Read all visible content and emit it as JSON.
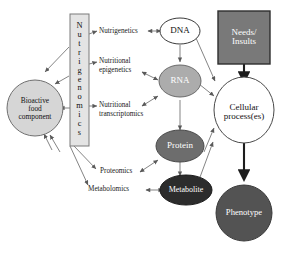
{
  "diagram": {
    "background": "#ffffff",
    "nodes": {
      "nutrigenomics": {
        "label": "Nutrigenomics",
        "letters": [
          "N",
          "u",
          "t",
          "r",
          "i",
          "g",
          "e",
          "n",
          "o",
          "m",
          "i",
          "c",
          "s"
        ],
        "shape": "rect-vertical-text",
        "fill": "#e4e4e4",
        "text_color": "#111111",
        "border": "#7a7a7a"
      },
      "bioactive": {
        "label": "Bioactive food component",
        "lines": [
          "Bioactive",
          "food",
          "component"
        ],
        "shape": "circle",
        "fill": "#d6d6d6",
        "text_color": "#111111",
        "border": "#6f6f6f"
      },
      "dna": {
        "label": "DNA",
        "lines": [
          "DNA"
        ],
        "shape": "ellipse",
        "fill": "#ffffff",
        "text_color": "#111111",
        "border": "#3a3a3a"
      },
      "rna": {
        "label": "RNA",
        "lines": [
          "RNA"
        ],
        "shape": "ellipse",
        "fill": "#acacac",
        "text_color": "#ffffff",
        "border": "#6a6a6a"
      },
      "protein": {
        "label": "Protein",
        "lines": [
          "Protein"
        ],
        "shape": "ellipse",
        "fill": "#6d6d6d",
        "text_color": "#ffffff",
        "border": "#4a4a4a"
      },
      "metabolite": {
        "label": "Metabolite",
        "lines": [
          "Metabolite"
        ],
        "shape": "ellipse",
        "fill": "#2c2c2c",
        "text_color": "#ffffff",
        "border": "#1a1a1a"
      },
      "needs_insults": {
        "label": "Needs/Insults",
        "lines": [
          "Needs/",
          "Insults"
        ],
        "shape": "rect",
        "fill": "#797979",
        "text_color": "#ffffff",
        "border": "#2e2e2e"
      },
      "cellular_process": {
        "label": "Cellular process(es)",
        "lines": [
          "Cellular",
          "process(es)"
        ],
        "shape": "ellipse",
        "fill": "#ffffff",
        "text_color": "#111111",
        "border": "#4a4a4a"
      },
      "phenotype": {
        "label": "Phenotype",
        "lines": [
          "Phenotype"
        ],
        "shape": "circle",
        "fill": "#535353",
        "text_color": "#ffffff",
        "border": "#3a3a3a"
      }
    },
    "edge_labels": [
      {
        "id": "nutrigenetics",
        "text": "Nutrigenetics"
      },
      {
        "id": "nutritional-epigenetics-l1",
        "text": "Nutritional"
      },
      {
        "id": "nutritional-epigenetics-l2",
        "text": "epigenetics"
      },
      {
        "id": "nutritional-transcriptomics-l1",
        "text": "Nutritional"
      },
      {
        "id": "nutritional-transcriptomics-l2",
        "text": "transcriptomics"
      },
      {
        "id": "proteomics",
        "text": "Proteomics"
      },
      {
        "id": "metabolomics",
        "text": "Metabolomics"
      }
    ],
    "edges": [
      {
        "from": "nutrigenetics",
        "to": "dna",
        "type": "double"
      },
      {
        "from": "nutritional-epigenetics",
        "to": "rna",
        "type": "double"
      },
      {
        "from": "nutritional-transcriptomics",
        "to": "rna",
        "type": "double"
      },
      {
        "from": "proteomics",
        "to": "protein",
        "type": "double"
      },
      {
        "from": "metabolomics",
        "to": "metabolite",
        "type": "double"
      },
      {
        "from": "dna",
        "to": "rna",
        "type": "single"
      },
      {
        "from": "rna",
        "to": "protein",
        "type": "single"
      },
      {
        "from": "protein",
        "to": "metabolite",
        "type": "single"
      },
      {
        "from": "dna",
        "to": "cellular_process",
        "type": "single"
      },
      {
        "from": "rna",
        "to": "cellular_process",
        "type": "single"
      },
      {
        "from": "protein",
        "to": "cellular_process",
        "type": "single"
      },
      {
        "from": "metabolite",
        "to": "cellular_process",
        "type": "single"
      },
      {
        "from": "needs_insults",
        "to": "cellular_process",
        "type": "single-bold"
      },
      {
        "from": "cellular_process",
        "to": "phenotype",
        "type": "single-bold"
      },
      {
        "from": "nutrigenomics",
        "to": "bioactive",
        "type": "single"
      },
      {
        "from": "nutrigenomics",
        "to": "nutrigenetics",
        "type": "single"
      },
      {
        "from": "nutrigenomics",
        "to": "nutritional-epigenetics",
        "type": "single"
      },
      {
        "from": "nutrigenomics",
        "to": "nutritional-transcriptomics",
        "type": "single"
      },
      {
        "from": "nutrigenomics",
        "to": "proteomics",
        "type": "single"
      },
      {
        "from": "nutrigenomics",
        "to": "metabolomics",
        "type": "single"
      }
    ]
  }
}
